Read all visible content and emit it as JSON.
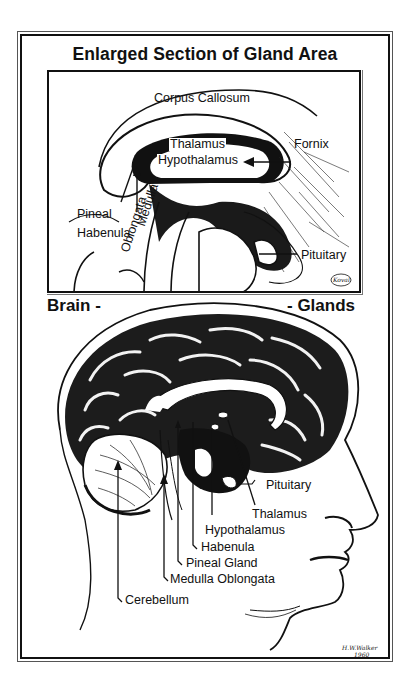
{
  "diagram": {
    "title": "Enlarged Section of Gland Area",
    "left_heading": "Brain -",
    "right_heading": "- Glands",
    "colors": {
      "ink": "#111111",
      "paper": "#ffffff"
    },
    "inset": {
      "labels": {
        "corpus_callosum": "Corpus Callosum",
        "thalamus": "Thalamus",
        "hypothalamus": "Hypothalamus",
        "fornix": "Fornix",
        "pineal": "Pineal",
        "habenula": "Habenula",
        "medulla": "Medulla",
        "oblongata": "Oblongata",
        "pituitary": "Pituitary"
      },
      "signature": "Koval"
    },
    "main": {
      "labels": {
        "pituitary": "Pituitary",
        "thalamus": "Thalamus",
        "hypothalamus": "Hypothalamus",
        "habenula": "Habenula",
        "pineal_gland": "Pineal Gland",
        "medulla_oblongata": "Medulla Oblongata",
        "cerebellum": "Cerebellum"
      },
      "signature_name": "H.W.Walker",
      "signature_year": "1960"
    }
  }
}
